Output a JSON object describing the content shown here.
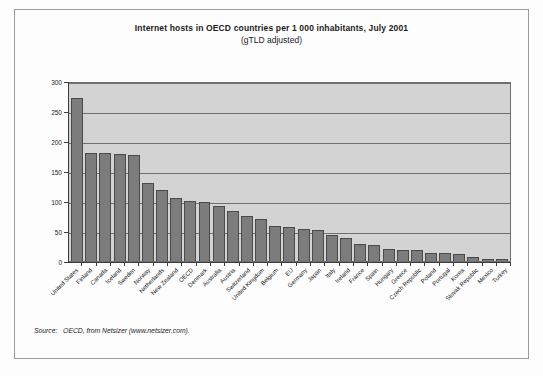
{
  "figure": {
    "title": "Internet hosts in OECD countries per 1 000 inhabitants, July 2001",
    "subtitle": "(gTLD adjusted)",
    "source_label": "Source:",
    "source_text": "OECD, from Netsizer (www.netsizer.com).",
    "frame_color": "#9a9a9a",
    "plot_background": "#d3d3d3",
    "bar_color": "#7c7c7c",
    "bar_border_color": "#4a4a4a",
    "gridline_color": "#6f6f6f",
    "axis_color": "#3c3c3c"
  },
  "chart_data": {
    "type": "bar",
    "title": "Internet hosts in OECD countries per 1 000 inhabitants, July 2001",
    "subtitle": "(gTLD adjusted)",
    "xlabel": "",
    "ylabel": "",
    "ylim": [
      0,
      300
    ],
    "yticks": [
      0,
      50,
      100,
      150,
      200,
      250,
      300
    ],
    "ytick_labels": [
      "0",
      "50",
      "100",
      "150",
      "200",
      "250",
      "300"
    ],
    "grid": true,
    "legend": false,
    "categories": [
      "United States",
      "Finland",
      "Canada",
      "Iceland",
      "Sweden",
      "Norway",
      "Netherlands",
      "New Zealand",
      "OECD",
      "Denmark",
      "Australia",
      "Austria",
      "Switzerland",
      "United Kingdom",
      "Belgium",
      "EU",
      "Germany",
      "Japan",
      "Italy",
      "Ireland",
      "France",
      "Spain",
      "Hungary",
      "Greece",
      "Czech Republic",
      "Poland",
      "Portugal",
      "Korea",
      "Slovak Republic",
      "Mexico",
      "Turkey"
    ],
    "values": [
      272,
      180,
      180,
      178,
      176,
      130,
      118,
      105,
      100,
      99,
      92,
      84,
      75,
      70,
      59,
      57,
      53,
      52,
      43,
      38,
      28,
      26,
      20,
      19,
      18,
      14,
      14,
      11,
      7,
      4,
      3
    ]
  }
}
